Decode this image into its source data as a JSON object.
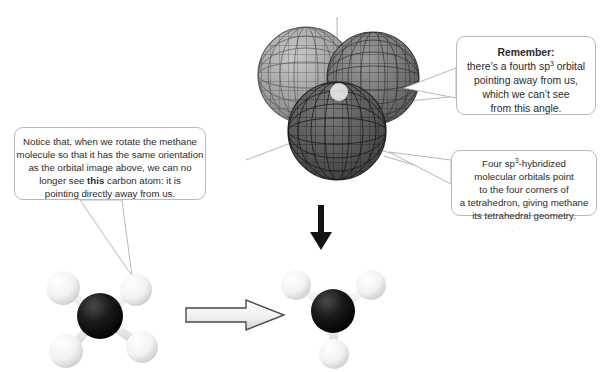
{
  "page": {
    "background_color": "#ffffff",
    "width": 602,
    "height": 372
  },
  "callouts": {
    "remember": {
      "name": "remember-callout",
      "heading": "Remember:",
      "line1_a": "there’s a fourth sp",
      "line1_sup": "3",
      "line1_b": " orbital",
      "line2": "pointing away from us,",
      "line3": "which we can’t see",
      "line4": "from this angle."
    },
    "tetrahedral": {
      "name": "tetrahedral-callout",
      "line1_a": "Four sp",
      "line1_sup": "3",
      "line1_b": "-hybridized",
      "line2": "molecular orbitals point",
      "line3": "to the four corners of",
      "line4": "a tetrahedron, giving methane",
      "line5": "its tetrahedral geometry."
    },
    "notice": {
      "name": "notice-callout",
      "line1": "Notice that, when we rotate the methane",
      "line2": "molecule so that it has the same orientation",
      "line3": "as the orbital image above, we can no",
      "line4_a": "longer see ",
      "line4_bold": "this",
      "line4_b": " carbon atom: it is",
      "line5": "pointing directly away from us."
    }
  },
  "orbital_diagram": {
    "name": "sp3-orbital-lobes",
    "description": "Three overlapping wireframe mesh spheres representing sp3 hybrid orbitals",
    "lobes": [
      {
        "label": "upper-left-lobe",
        "fill": "#9a9a9a"
      },
      {
        "label": "upper-right-lobe",
        "fill": "#6e6e6e"
      },
      {
        "label": "front-lower-lobe",
        "fill": "#555555"
      }
    ],
    "axis_line_color": "#b5b5b5"
  },
  "molecules": {
    "left": {
      "name": "methane-model-cross",
      "carbon_color": "#0d0d0d",
      "hydrogen_color": "#f4f4f4",
      "bond_color": "#e2e2e2",
      "hydrogen_count": 4
    },
    "right": {
      "name": "methane-model-rotated",
      "carbon_color": "#0d0d0d",
      "hydrogen_color": "#f4f4f4",
      "bond_color": "#e2e2e2",
      "hydrogen_count": 3
    }
  },
  "arrows": {
    "down": {
      "name": "down-arrow",
      "color": "#131313",
      "style": "solid"
    },
    "right": {
      "name": "right-arrow",
      "color": "#ffffff",
      "outline": "#4a4a4a",
      "style": "outlined"
    }
  },
  "artifact": {
    "text": "·"
  }
}
